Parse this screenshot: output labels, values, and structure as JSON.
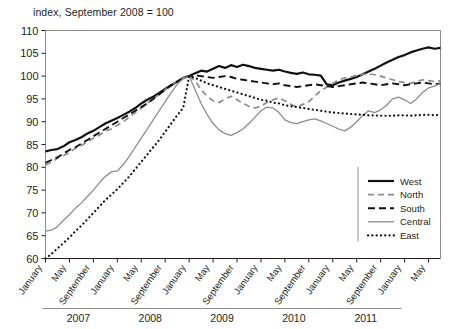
{
  "chart_data": {
    "type": "line",
    "title": "index, September 2008 = 100",
    "xlabel": "",
    "ylabel": "",
    "ylim": [
      60,
      110
    ],
    "ytick_labels": [
      "110",
      "105",
      "100",
      "95",
      "90",
      "85",
      "80",
      "75",
      "70",
      "65",
      "60"
    ],
    "ytick_values": [
      110,
      105,
      100,
      95,
      90,
      85,
      80,
      75,
      70,
      65,
      60
    ],
    "grid": false,
    "legend_position": "bottom-right",
    "x_month_labels": [
      "January",
      "May",
      "September"
    ],
    "year_groups": [
      "2007",
      "2008",
      "2009",
      "2010",
      "2011"
    ],
    "x_start": "January 2007",
    "x_end": "September 2011",
    "legend": [
      {
        "name": "West",
        "style": "solid",
        "color": "#111111",
        "width": 2.2
      },
      {
        "name": "North",
        "style": "dashed",
        "color": "#8c8c8c",
        "width": 1.7
      },
      {
        "name": "South",
        "style": "dashed",
        "color": "#111111",
        "width": 1.9
      },
      {
        "name": "Central",
        "style": "solid",
        "color": "#8c8c8c",
        "width": 1.3
      },
      {
        "name": "East",
        "style": "dotted",
        "color": "#111111",
        "width": 2.2
      }
    ],
    "series": [
      {
        "name": "West",
        "values": [
          83.5,
          83.8,
          84.0,
          84.6,
          85.5,
          86.0,
          86.6,
          87.4,
          88.0,
          88.8,
          89.6,
          90.2,
          90.8,
          91.5,
          92.2,
          93.0,
          94.0,
          94.8,
          95.5,
          96.3,
          97.2,
          98.0,
          98.8,
          99.6,
          100.0,
          100.6,
          101.2,
          101.0,
          101.6,
          102.2,
          101.8,
          102.4,
          102.0,
          102.5,
          102.2,
          101.8,
          101.6,
          101.4,
          101.2,
          101.4,
          101.0,
          100.7,
          100.5,
          100.8,
          100.4,
          100.3,
          100.1,
          98.2,
          98.0,
          98.6,
          99.0,
          99.4,
          99.8,
          100.4,
          101.0,
          101.6,
          102.3,
          103.0,
          103.6,
          104.2,
          104.6,
          105.2,
          105.6,
          106.0,
          106.3,
          106.0,
          106.2
        ]
      },
      {
        "name": "North",
        "values": [
          80.5,
          81.2,
          82.0,
          82.6,
          83.2,
          84.2,
          84.8,
          85.6,
          86.4,
          87.0,
          88.0,
          88.4,
          89.2,
          90.0,
          91.0,
          92.0,
          93.0,
          94.0,
          95.0,
          96.0,
          97.0,
          98.0,
          99.0,
          99.6,
          100.0,
          99.0,
          97.0,
          95.6,
          94.6,
          94.2,
          95.0,
          95.6,
          94.8,
          94.0,
          93.4,
          93.0,
          93.4,
          94.2,
          94.8,
          95.2,
          94.6,
          93.8,
          93.2,
          93.8,
          94.4,
          95.6,
          96.8,
          97.6,
          98.4,
          99.2,
          99.6,
          99.8,
          100.2,
          100.4,
          100.5,
          100.3,
          100.0,
          99.6,
          99.2,
          98.8,
          98.6,
          98.4,
          98.8,
          99.2,
          99.0,
          98.8,
          99.0
        ]
      },
      {
        "name": "South",
        "values": [
          81.0,
          81.6,
          82.2,
          83.0,
          83.8,
          84.4,
          85.2,
          86.0,
          86.8,
          87.6,
          88.4,
          89.2,
          90.0,
          90.8,
          91.6,
          92.4,
          93.2,
          94.0,
          95.0,
          96.0,
          97.0,
          98.0,
          98.8,
          99.5,
          100.0,
          100.2,
          100.0,
          99.8,
          99.6,
          99.8,
          100.0,
          99.8,
          99.4,
          99.2,
          99.0,
          98.8,
          98.6,
          98.4,
          98.2,
          98.4,
          98.0,
          97.8,
          97.6,
          97.8,
          98.0,
          98.2,
          98.0,
          97.8,
          97.6,
          97.8,
          98.0,
          98.2,
          98.4,
          98.6,
          98.4,
          98.2,
          98.0,
          98.2,
          98.4,
          98.2,
          98.0,
          98.2,
          98.4,
          98.6,
          98.4,
          98.2,
          98.4
        ]
      },
      {
        "name": "Central",
        "values": [
          66.0,
          66.2,
          67.0,
          68.4,
          69.6,
          71.0,
          72.2,
          73.6,
          75.0,
          76.6,
          78.0,
          79.0,
          79.2,
          80.6,
          82.4,
          84.4,
          86.4,
          88.4,
          90.4,
          92.4,
          94.4,
          96.4,
          98.2,
          99.4,
          100.0,
          97.0,
          94.0,
          91.6,
          89.6,
          88.2,
          87.4,
          87.0,
          87.6,
          88.4,
          89.6,
          91.0,
          92.4,
          93.2,
          93.0,
          92.0,
          90.4,
          89.8,
          89.6,
          90.0,
          90.4,
          90.6,
          90.2,
          89.6,
          89.0,
          88.4,
          88.0,
          88.8,
          90.0,
          91.4,
          92.4,
          92.0,
          92.6,
          93.6,
          95.0,
          95.4,
          94.8,
          94.0,
          95.0,
          96.4,
          97.4,
          97.8,
          98.4
        ]
      },
      {
        "name": "East",
        "values": [
          60.0,
          61.0,
          62.2,
          63.4,
          64.6,
          66.0,
          67.2,
          68.6,
          70.0,
          71.4,
          72.8,
          74.0,
          75.2,
          76.6,
          78.0,
          79.6,
          81.2,
          82.8,
          84.4,
          86.0,
          87.8,
          89.6,
          91.4,
          93.0,
          100.0,
          99.6,
          99.0,
          98.4,
          98.0,
          97.6,
          97.2,
          96.8,
          96.4,
          96.0,
          95.6,
          95.2,
          94.8,
          94.6,
          94.2,
          94.0,
          93.6,
          93.4,
          93.2,
          93.0,
          92.8,
          92.6,
          92.4,
          92.2,
          92.0,
          91.9,
          91.8,
          91.7,
          91.6,
          91.5,
          91.4,
          91.4,
          91.3,
          91.3,
          91.3,
          91.4,
          91.4,
          91.3,
          91.4,
          91.5,
          91.5,
          91.4,
          91.5
        ]
      }
    ]
  }
}
